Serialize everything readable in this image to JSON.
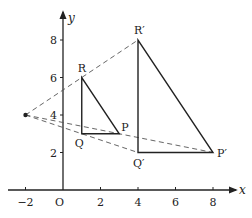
{
  "figure": {
    "colors": {
      "line": "#222222",
      "dashed": "#555555",
      "background": "#ffffff"
    }
  },
  "axes": {
    "x_label": "x",
    "y_label": "y",
    "origin_label": "O",
    "x_ticks": [
      {
        "value": -2,
        "label": "−2"
      },
      {
        "value": 2,
        "label": "2"
      },
      {
        "value": 4,
        "label": "4"
      },
      {
        "value": 6,
        "label": "6"
      },
      {
        "value": 8,
        "label": "8"
      }
    ],
    "y_ticks": [
      {
        "value": 2,
        "label": "2"
      },
      {
        "value": 4,
        "label": "4"
      },
      {
        "value": 6,
        "label": "6"
      },
      {
        "value": 8,
        "label": "8"
      }
    ],
    "x_range": [
      -2.6,
      9.3
    ],
    "y_range": [
      -0.5,
      9.5
    ]
  },
  "points": {
    "centre": {
      "x": -2,
      "y": 4,
      "label": ""
    },
    "P": {
      "x": 3,
      "y": 3,
      "label": "P"
    },
    "Q": {
      "x": 1,
      "y": 3,
      "label": "Q"
    },
    "R": {
      "x": 1,
      "y": 6,
      "label": "R"
    },
    "P2": {
      "x": 8,
      "y": 2,
      "label": "P′"
    },
    "Q2": {
      "x": 4,
      "y": 2,
      "label": "Q′"
    },
    "R2": {
      "x": 4,
      "y": 8,
      "label": "R′"
    }
  },
  "triangles": [
    {
      "name": "PQR",
      "vertices": [
        "P",
        "Q",
        "R"
      ]
    },
    {
      "name": "P'Q'R'",
      "vertices": [
        "P2",
        "Q2",
        "R2"
      ]
    }
  ],
  "rays": [
    {
      "from": "centre",
      "to": "R2"
    },
    {
      "from": "centre",
      "to": "P2"
    },
    {
      "from": "centre",
      "to": "Q2"
    }
  ]
}
